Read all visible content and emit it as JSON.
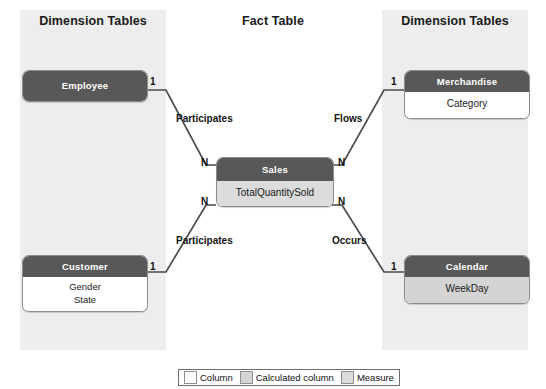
{
  "zones": {
    "left": {
      "title": "Dimension Tables"
    },
    "middle": {
      "title": "Fact Table"
    },
    "right": {
      "title": "Dimension Tables"
    }
  },
  "tables": {
    "employee": {
      "name": "Employee",
      "rows": []
    },
    "customer": {
      "name": "Customer",
      "row_kind": "column",
      "rows": [
        {
          "label": "Gender"
        },
        {
          "label": "State"
        }
      ]
    },
    "sales": {
      "name": "Sales",
      "row_kind": "measure",
      "rows": [
        {
          "label": "TotalQuantitySold"
        }
      ]
    },
    "merchandise": {
      "name": "Merchandise",
      "row_kind": "column",
      "rows": [
        {
          "label": "Category"
        }
      ]
    },
    "calendar": {
      "name": "Calendar",
      "row_kind": "calculated",
      "rows": [
        {
          "label": "WeekDay"
        }
      ]
    }
  },
  "relationships": [
    {
      "id": "employee-sales",
      "label": "Participates",
      "from_cardinality": "1",
      "to_cardinality": "N"
    },
    {
      "id": "merchandise-sales",
      "label": "Flows",
      "from_cardinality": "1",
      "to_cardinality": "N"
    },
    {
      "id": "customer-sales",
      "label": "Participates",
      "from_cardinality": "1",
      "to_cardinality": "N"
    },
    {
      "id": "calendar-sales",
      "label": "Occurs",
      "from_cardinality": "1",
      "to_cardinality": "N"
    }
  ],
  "cardinality": {
    "employee_one": "1",
    "customer_one": "1",
    "merchandise_one": "1",
    "calendar_one": "1",
    "sales_top_left": "N",
    "sales_bottom_left": "N",
    "sales_top_right": "N",
    "sales_bottom_right": "N"
  },
  "legend": {
    "items": [
      {
        "label": "Column",
        "swatch": "sw-column",
        "color": "#fbfbfb"
      },
      {
        "label": "Calculated column",
        "swatch": "sw-calculated",
        "color": "#d4d4d4"
      },
      {
        "label": "Measure",
        "swatch": "sw-measure",
        "color": "#dcdcdc"
      }
    ]
  },
  "colors": {
    "table_header": "#585858",
    "zone_panel": "#ededed",
    "connector": "#4a4a4a",
    "column_row": "#ffffff",
    "calculated_row": "#d4d4d4",
    "measure_row": "#dcdcdc"
  }
}
